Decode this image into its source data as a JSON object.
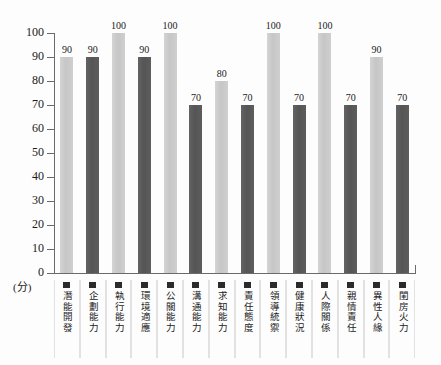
{
  "chart_data": {
    "type": "bar",
    "title": "",
    "subtitle": "",
    "xlabel": "",
    "ylabel": "(分)",
    "ylim": [
      0,
      100
    ],
    "grid": false,
    "legend": "none",
    "ytick_labels": [
      "100",
      "90",
      "80",
      "70",
      "60",
      "50",
      "40",
      "30",
      "20",
      "10",
      "0"
    ],
    "ytick_values": [
      100,
      90,
      80,
      70,
      60,
      50,
      40,
      30,
      20,
      10,
      0
    ],
    "categories": [
      "潛能開發",
      "企劃能力",
      "執行能力",
      "環境適應",
      "公關能力",
      "溝通能力",
      "求知能力",
      "責任態度",
      "領導統禦",
      "健康狀況",
      "人際關係",
      "親情責任",
      "異性人緣",
      "閨房火力"
    ],
    "values": [
      90,
      90,
      100,
      90,
      100,
      70,
      80,
      70,
      100,
      70,
      100,
      70,
      90,
      70
    ],
    "bar_styles": [
      "light",
      "dark",
      "light",
      "dark",
      "light",
      "dark",
      "light",
      "dark",
      "light",
      "dark",
      "light",
      "dark",
      "light",
      "dark"
    ],
    "colors": {
      "bar_light": "#c8c8c8",
      "bar_dark": "#585858",
      "axis": "#6a6a6a",
      "text": "#1b1b1b",
      "swatch": "#2b2b2b",
      "background": "#fdfdfd",
      "cell_divider": "#e2e2e2"
    }
  }
}
